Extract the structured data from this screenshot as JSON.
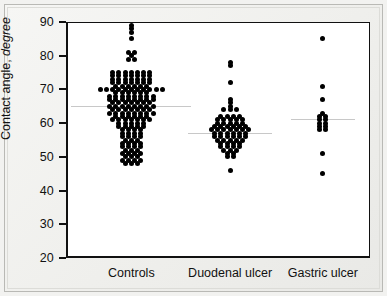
{
  "figure": {
    "background_color": "#f2f2f0",
    "plot_background_color": "#ffffff",
    "axis_color": "#111111",
    "dot_color": "#000000",
    "median_line_color": "#c8c8c8"
  },
  "axes": {
    "y_title_main": "Contact angle, ",
    "y_title_unit": "degree",
    "y_ticks": [
      20,
      30,
      40,
      50,
      60,
      70,
      80,
      90
    ],
    "y_min": 20,
    "y_max": 90
  },
  "chart_data": {
    "type": "scatter",
    "title": "",
    "xlabel": "",
    "ylabel": "Contact angle, degree",
    "ylim": [
      20,
      90
    ],
    "yticks": [
      20,
      30,
      40,
      50,
      60,
      70,
      80,
      90
    ],
    "grid": false,
    "legend": "none",
    "categories": [
      "Controls",
      "Duodenal ulcer",
      "Gastric ulcer"
    ],
    "series": [
      {
        "name": "Controls",
        "center_x": 0.215,
        "median": 65,
        "n": 119,
        "note": "dense symmetric dot-histogram, mode at 72-74",
        "points": [
          {
            "value": 89,
            "count": 1
          },
          {
            "value": 88,
            "count": 1
          },
          {
            "value": 87,
            "count": 1
          },
          {
            "value": 85,
            "count": 1
          },
          {
            "value": 81,
            "count": 2
          },
          {
            "value": 80,
            "count": 1
          },
          {
            "value": 79,
            "count": 2
          },
          {
            "value": 75,
            "count": 7
          },
          {
            "value": 74,
            "count": 7
          },
          {
            "value": 73,
            "count": 7
          },
          {
            "value": 72,
            "count": 7
          },
          {
            "value": 71,
            "count": 6
          },
          {
            "value": 70,
            "count": 11
          },
          {
            "value": 69,
            "count": 6
          },
          {
            "value": 68,
            "count": 8
          },
          {
            "value": 67,
            "count": 8
          },
          {
            "value": 66,
            "count": 7
          },
          {
            "value": 65,
            "count": 8
          },
          {
            "value": 64,
            "count": 7
          },
          {
            "value": 63,
            "count": 8
          },
          {
            "value": 62,
            "count": 6
          },
          {
            "value": 61,
            "count": 7
          },
          {
            "value": 60,
            "count": 5
          },
          {
            "value": 59,
            "count": 5
          },
          {
            "value": 58,
            "count": 4
          },
          {
            "value": 57,
            "count": 4
          },
          {
            "value": 56,
            "count": 4
          },
          {
            "value": 55,
            "count": 3
          },
          {
            "value": 54,
            "count": 4
          },
          {
            "value": 53,
            "count": 4
          },
          {
            "value": 52,
            "count": 3
          },
          {
            "value": 51,
            "count": 4
          },
          {
            "value": 50,
            "count": 3
          },
          {
            "value": 49,
            "count": 4
          },
          {
            "value": 48,
            "count": 3
          }
        ]
      },
      {
        "name": "Duodenal ulcer",
        "center_x": 0.54,
        "median": 57,
        "n": 62,
        "note": "tighter cluster, mode near 56-58",
        "points": [
          {
            "value": 78,
            "count": 1
          },
          {
            "value": 77,
            "count": 1
          },
          {
            "value": 72,
            "count": 1
          },
          {
            "value": 67,
            "count": 1
          },
          {
            "value": 66,
            "count": 1
          },
          {
            "value": 65,
            "count": 1
          },
          {
            "value": 64,
            "count": 3
          },
          {
            "value": 62,
            "count": 4
          },
          {
            "value": 61,
            "count": 5
          },
          {
            "value": 60,
            "count": 5
          },
          {
            "value": 59,
            "count": 6
          },
          {
            "value": 58,
            "count": 7
          },
          {
            "value": 57,
            "count": 6
          },
          {
            "value": 56,
            "count": 6
          },
          {
            "value": 55,
            "count": 5
          },
          {
            "value": 54,
            "count": 4
          },
          {
            "value": 53,
            "count": 4
          },
          {
            "value": 52,
            "count": 3
          },
          {
            "value": 51,
            "count": 2
          },
          {
            "value": 50,
            "count": 2
          },
          {
            "value": 46,
            "count": 1
          }
        ]
      },
      {
        "name": "Gastric ulcer",
        "center_x": 0.845,
        "median": 61,
        "n": 16,
        "note": "sparse, single-column stack",
        "points": [
          {
            "value": 85,
            "count": 1
          },
          {
            "value": 71,
            "count": 1
          },
          {
            "value": 67,
            "count": 1
          },
          {
            "value": 63,
            "count": 1
          },
          {
            "value": 62,
            "count": 2
          },
          {
            "value": 61,
            "count": 2
          },
          {
            "value": 60,
            "count": 2
          },
          {
            "value": 59,
            "count": 2
          },
          {
            "value": 58,
            "count": 2
          },
          {
            "value": 51,
            "count": 1
          },
          {
            "value": 45,
            "count": 1
          }
        ]
      }
    ]
  }
}
